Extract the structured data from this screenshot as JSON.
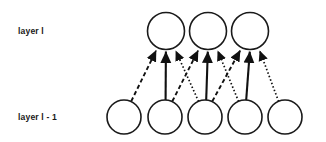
{
  "figure": {
    "type": "neural-network-layer-diagram",
    "background_color": "#ffffff",
    "stroke_color": "#111111",
    "width": 326,
    "height": 142
  },
  "labels": {
    "upper_layer": "layer l",
    "lower_layer": "layer l - 1"
  },
  "layers": [
    {
      "id": "upper",
      "name": "layer l",
      "label": "layer l",
      "node_count": 3,
      "center_y": 31,
      "radius": 18.5,
      "nodes": [
        {
          "index": 0,
          "cx": 166,
          "cy": 31,
          "r": 18.5
        },
        {
          "index": 1,
          "cx": 208,
          "cy": 31,
          "r": 18.5
        },
        {
          "index": 2,
          "cx": 250,
          "cy": 31,
          "r": 18.5
        }
      ]
    },
    {
      "id": "lower",
      "name": "layer l - 1",
      "label": "layer l - 1",
      "node_count": 5,
      "center_y": 117,
      "radius": 17,
      "nodes": [
        {
          "index": 0,
          "cx": 124,
          "cy": 117,
          "r": 17
        },
        {
          "index": 1,
          "cx": 165,
          "cy": 117,
          "r": 17
        },
        {
          "index": 2,
          "cx": 205,
          "cy": 117,
          "r": 17
        },
        {
          "index": 3,
          "cx": 245,
          "cy": 117,
          "r": 17
        },
        {
          "index": 4,
          "cx": 285,
          "cy": 117,
          "r": 17
        }
      ]
    }
  ],
  "edges": [
    {
      "id": "e0",
      "from_layer": "lower",
      "from_node": 0,
      "to_layer": "upper",
      "to_node": 0,
      "style": "dashed",
      "direction": "upward",
      "arrowhead": true
    },
    {
      "id": "e1",
      "from_layer": "lower",
      "from_node": 1,
      "to_layer": "upper",
      "to_node": 0,
      "style": "solid",
      "direction": "upward",
      "arrowhead": true
    },
    {
      "id": "e2",
      "from_layer": "lower",
      "from_node": 2,
      "to_layer": "upper",
      "to_node": 0,
      "style": "dotted",
      "direction": "upward",
      "arrowhead": true
    },
    {
      "id": "e3",
      "from_layer": "lower",
      "from_node": 1,
      "to_layer": "upper",
      "to_node": 1,
      "style": "dashed",
      "direction": "upward",
      "arrowhead": true
    },
    {
      "id": "e4",
      "from_layer": "lower",
      "from_node": 2,
      "to_layer": "upper",
      "to_node": 1,
      "style": "solid",
      "direction": "upward",
      "arrowhead": true
    },
    {
      "id": "e5",
      "from_layer": "lower",
      "from_node": 3,
      "to_layer": "upper",
      "to_node": 1,
      "style": "dotted",
      "direction": "upward",
      "arrowhead": true
    },
    {
      "id": "e6",
      "from_layer": "lower",
      "from_node": 2,
      "to_layer": "upper",
      "to_node": 2,
      "style": "dashed",
      "direction": "upward",
      "arrowhead": true
    },
    {
      "id": "e7",
      "from_layer": "lower",
      "from_node": 3,
      "to_layer": "upper",
      "to_node": 2,
      "style": "solid",
      "direction": "upward",
      "arrowhead": true
    },
    {
      "id": "e8",
      "from_layer": "lower",
      "from_node": 4,
      "to_layer": "upper",
      "to_node": 2,
      "style": "dotted",
      "direction": "upward",
      "arrowhead": true
    }
  ],
  "label_positions": {
    "upper_layer": {
      "x": 18,
      "y": 34
    },
    "lower_layer": {
      "x": 18,
      "y": 120
    }
  }
}
